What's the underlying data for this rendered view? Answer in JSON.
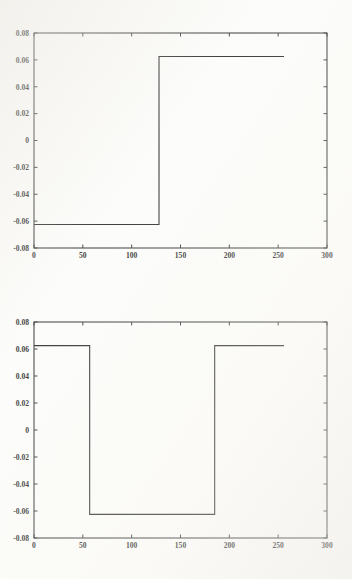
{
  "figure": {
    "background_color": "#fcfcfa",
    "axis_color": "#3a3a3a",
    "line_color": "#2b2b2b"
  },
  "chart_data": [
    {
      "type": "line",
      "title": "",
      "xlabel": "",
      "ylabel": "",
      "xlim": [
        0,
        300
      ],
      "ylim": [
        -0.08,
        0.08
      ],
      "xticks": [
        0,
        50,
        100,
        150,
        200,
        250,
        300
      ],
      "xtick_labels": [
        "0",
        "50",
        "100",
        "150",
        "200",
        "250",
        "300"
      ],
      "yticks": [
        -0.08,
        -0.06,
        -0.04,
        -0.02,
        0,
        0.02,
        0.04,
        0.06,
        0.08
      ],
      "ytick_labels": [
        "-0.08",
        "-0.06",
        "-0.04",
        "-0.02",
        "0",
        "0.02",
        "0.04",
        "0.06",
        "0.08"
      ],
      "grid": false,
      "legend": false,
      "description": "single step transition from low to high",
      "series": [
        {
          "name": "step signal",
          "x": [
            0,
            128,
            128,
            256
          ],
          "values": [
            -0.0625,
            -0.0625,
            0.0625,
            0.0625
          ]
        }
      ]
    },
    {
      "type": "line",
      "title": "",
      "xlabel": "",
      "ylabel": "",
      "xlim": [
        0,
        300
      ],
      "ylim": [
        -0.08,
        0.08
      ],
      "xticks": [
        0,
        50,
        100,
        150,
        200,
        250,
        300
      ],
      "xtick_labels": [
        "0",
        "50",
        "100",
        "150",
        "200",
        "250",
        "300"
      ],
      "yticks": [
        -0.08,
        -0.06,
        -0.04,
        -0.02,
        0,
        0.02,
        0.04,
        0.06,
        0.08
      ],
      "ytick_labels": [
        "-0.08",
        "-0.06",
        "-0.04",
        "-0.02",
        "0",
        "0.02",
        "0.04",
        "0.06",
        "0.08"
      ],
      "grid": false,
      "legend": false,
      "description": "negative pulse: high, drops low, returns high",
      "series": [
        {
          "name": "pulse signal",
          "x": [
            0,
            57,
            57,
            185,
            185,
            256
          ],
          "values": [
            0.0625,
            0.0625,
            -0.0625,
            -0.0625,
            0.0625,
            0.0625
          ]
        }
      ]
    }
  ]
}
